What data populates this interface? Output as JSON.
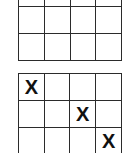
{
  "boards": [
    {
      "name": "top-board",
      "rows": [
        [
          "",
          "",
          "",
          ""
        ],
        [
          "",
          "",
          "",
          ""
        ],
        [
          "",
          "",
          "",
          ""
        ]
      ]
    },
    {
      "name": "bottom-board",
      "rows": [
        [
          "X",
          "",
          "",
          ""
        ],
        [
          "",
          "",
          "X",
          ""
        ],
        [
          "",
          "",
          "",
          "X"
        ]
      ]
    }
  ]
}
